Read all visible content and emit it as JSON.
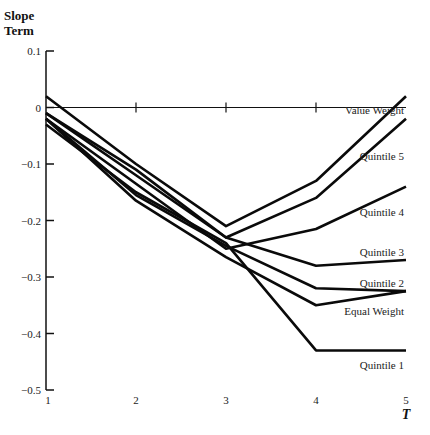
{
  "chart_data": {
    "type": "line",
    "title": "",
    "ylabel": "Slope Term",
    "xlabel": "T",
    "x": [
      1,
      2,
      3,
      4,
      5
    ],
    "xticks": [
      "1",
      "2",
      "3",
      "4",
      "5"
    ],
    "ylim": [
      -0.5,
      0.1
    ],
    "yticks": [
      "0.1",
      "0",
      "-0.1",
      "-0.2",
      "-0.3",
      "-0.4",
      "-0.5"
    ],
    "ytick_values": [
      0.1,
      0,
      -0.1,
      -0.2,
      -0.3,
      -0.4,
      -0.5
    ],
    "grid": false,
    "legend": "inline labels at right end",
    "series": [
      {
        "name": "Value Weight",
        "values": [
          0.02,
          -0.1,
          -0.21,
          -0.13,
          0.02
        ]
      },
      {
        "name": "Quintile 5",
        "values": [
          -0.01,
          -0.12,
          -0.23,
          -0.16,
          -0.02
        ]
      },
      {
        "name": "Quintile 4",
        "values": [
          -0.02,
          -0.135,
          -0.25,
          -0.215,
          -0.14
        ]
      },
      {
        "name": "Quintile 3",
        "values": [
          -0.01,
          -0.11,
          -0.23,
          -0.28,
          -0.27
        ]
      },
      {
        "name": "Quintile 2",
        "values": [
          -0.02,
          -0.155,
          -0.245,
          -0.32,
          -0.325
        ]
      },
      {
        "name": "Equal Weight",
        "values": [
          -0.02,
          -0.165,
          -0.265,
          -0.35,
          -0.325
        ]
      },
      {
        "name": "Quintile 1",
        "values": [
          -0.03,
          -0.15,
          -0.24,
          -0.43,
          -0.43
        ]
      }
    ],
    "label_positions": [
      {
        "name": "Value Weight",
        "y": -0.005
      },
      {
        "name": "Quintile 5",
        "y": -0.085
      },
      {
        "name": "Quintile 4",
        "y": -0.185
      },
      {
        "name": "Quintile 3",
        "y": -0.255
      },
      {
        "name": "Quintile 2",
        "y": -0.31
      },
      {
        "name": "Equal Weight",
        "y": -0.36
      },
      {
        "name": "Quintile 1",
        "y": -0.455
      }
    ]
  },
  "axis": {
    "y_title_line1": "Slope",
    "y_title_line2": "Term",
    "x_title": "T"
  }
}
